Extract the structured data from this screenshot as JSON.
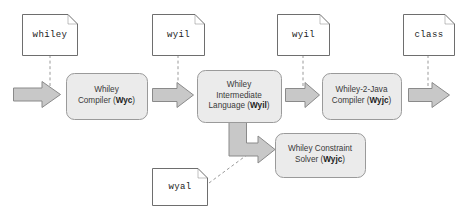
{
  "diagram": {
    "colors": {
      "doc_fill": "#ffffff",
      "doc_stroke": "#6e6e6e",
      "process_fill": "#ebebeb",
      "process_stroke": "#9a9a9a",
      "arrow_fill": "#c8c8c8",
      "arrow_stroke": "#8a8a8a",
      "connector": "#9a9a9a",
      "text": "#333333",
      "background": "#ffffff"
    },
    "documents": [
      {
        "id": "doc-whiley",
        "label": "whiley",
        "x": 22,
        "y": 14,
        "w": 56,
        "h": 41
      },
      {
        "id": "doc-wyil-1",
        "label": "wyil",
        "x": 152,
        "y": 14,
        "w": 53,
        "h": 41
      },
      {
        "id": "doc-wyil-2",
        "label": "wyil",
        "x": 277,
        "y": 14,
        "w": 53,
        "h": 41
      },
      {
        "id": "doc-class",
        "label": "class",
        "x": 403,
        "y": 14,
        "w": 52,
        "h": 41
      },
      {
        "id": "doc-wyal",
        "label": "wyal",
        "x": 152,
        "y": 168,
        "w": 56,
        "h": 38
      }
    ],
    "processes": [
      {
        "id": "proc-whiley-compiler",
        "lines": [
          "Whiley",
          "Compiler (<b>Wyc</b>)"
        ],
        "plain": "Whiley Compiler (Wyc)",
        "x": 66,
        "y": 73,
        "w": 81,
        "h": 46
      },
      {
        "id": "proc-wyil",
        "lines": [
          "Whiley",
          "Intermediate",
          "Language (<b>Wyil</b>)"
        ],
        "plain": "Whiley Intermediate Language (Wyil)",
        "x": 197,
        "y": 70,
        "w": 84,
        "h": 52
      },
      {
        "id": "proc-wyjc",
        "lines": [
          "Whiley-2-Java",
          "Compiler (<b>Wyjc</b>)"
        ],
        "plain": "Whiley-2-Java Compiler (Wyjc)",
        "x": 322,
        "y": 73,
        "w": 79,
        "h": 46
      },
      {
        "id": "proc-constraint-solver",
        "lines": [
          "Whiley Constraint",
          "Solver (<b>Wyjc</b>)"
        ],
        "plain": "Whiley Constraint Solver (Wyjc)",
        "x": 275,
        "y": 133,
        "w": 90,
        "h": 44
      }
    ],
    "arrows": [
      {
        "id": "arrow-source-to-compiler",
        "kind": "right",
        "x": 13,
        "y": 81,
        "w": 48,
        "h": 27
      },
      {
        "id": "arrow-compiler-to-wyil",
        "kind": "right",
        "x": 152,
        "y": 82,
        "w": 42,
        "h": 26
      },
      {
        "id": "arrow-wyil-to-wyjc",
        "kind": "right",
        "x": 285,
        "y": 82,
        "w": 35,
        "h": 26
      },
      {
        "id": "arrow-wyjc-to-class",
        "kind": "right",
        "x": 408,
        "y": 82,
        "w": 42,
        "h": 26
      },
      {
        "id": "arrow-wyil-to-solver",
        "kind": "bent",
        "x": 228,
        "y": 120,
        "w": 48,
        "h": 48
      }
    ],
    "connectors": [
      {
        "id": "connector-whiley-doc",
        "kind": "dashed-vertical",
        "x1": 50,
        "y1": 55,
        "x2": 50,
        "y2": 88
      },
      {
        "id": "connector-wyil-doc-1",
        "kind": "dashed-vertical",
        "x1": 178,
        "y1": 55,
        "x2": 178,
        "y2": 88
      },
      {
        "id": "connector-wyil-doc-2",
        "kind": "dashed-vertical",
        "x1": 303,
        "y1": 55,
        "x2": 303,
        "y2": 88
      },
      {
        "id": "connector-class-doc",
        "kind": "dashed-vertical",
        "x1": 428,
        "y1": 55,
        "x2": 428,
        "y2": 88
      },
      {
        "id": "connector-wyal-doc",
        "kind": "dashed-diagonal",
        "x1": 208,
        "y1": 182,
        "x2": 258,
        "y2": 145
      }
    ]
  }
}
